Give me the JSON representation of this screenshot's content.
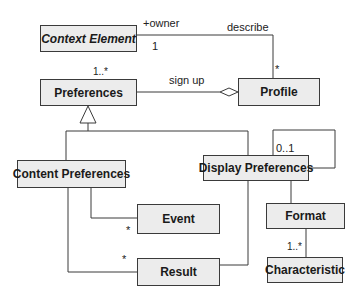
{
  "diagram": {
    "type": "UML class diagram",
    "classes": [
      {
        "id": "context_element",
        "name": "Context Element",
        "abstract": true
      },
      {
        "id": "preferences",
        "name": "Preferences"
      },
      {
        "id": "profile",
        "name": "Profile"
      },
      {
        "id": "content_preferences",
        "name": "Content Preferences"
      },
      {
        "id": "display_preferences",
        "name": "Display Preferences"
      },
      {
        "id": "event",
        "name": "Event"
      },
      {
        "id": "result",
        "name": "Result"
      },
      {
        "id": "format",
        "name": "Format"
      },
      {
        "id": "characteristic",
        "name": "Characteristic"
      }
    ],
    "relations": [
      {
        "from": "Context Element",
        "to": "Profile",
        "type": "association",
        "label": "describe",
        "role": "+owner",
        "from_mult": "1",
        "to_mult": "*"
      },
      {
        "from": "Preferences",
        "to": "Profile",
        "type": "aggregation",
        "label": "sign up",
        "from_mult": "1..*"
      },
      {
        "from": "Content Preferences",
        "to": "Preferences",
        "type": "generalization"
      },
      {
        "from": "Display Preferences",
        "to": "Preferences",
        "type": "generalization"
      },
      {
        "from": "Display Preferences",
        "to": "Display Preferences",
        "type": "self-association",
        "mult": "0..1"
      },
      {
        "from": "Content Preferences",
        "to": "Event",
        "type": "association",
        "to_mult": "*"
      },
      {
        "from": "Content Preferences",
        "to": "Result",
        "type": "association",
        "to_mult": "*"
      },
      {
        "from": "Display Preferences",
        "to": "Result",
        "type": "association"
      },
      {
        "from": "Display Preferences",
        "to": "Format",
        "type": "association"
      },
      {
        "from": "Format",
        "to": "Characteristic",
        "type": "association",
        "to_mult": "1..*"
      }
    ]
  },
  "labels": {
    "owner_role": "+owner",
    "describe": "describe",
    "ctx_mult": "1",
    "profile_mult": "*",
    "pref_mult": "1..*",
    "sign_up": "sign up",
    "self_mult": "0..1",
    "event_mult": "*",
    "result_mult": "*",
    "char_mult": "1..*"
  },
  "colors": {
    "box_fill": "#ececec",
    "line": "#3a3a3a"
  }
}
